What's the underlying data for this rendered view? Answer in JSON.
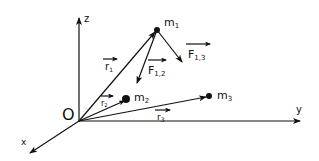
{
  "diagram": {
    "axes": {
      "origin": "O",
      "x": "x",
      "y": "y",
      "z": "z"
    },
    "masses": [
      {
        "id": "m1",
        "base": "m",
        "sub": "1"
      },
      {
        "id": "m2",
        "base": "m",
        "sub": "2"
      },
      {
        "id": "m3",
        "base": "m",
        "sub": "3"
      }
    ],
    "position_vectors": [
      {
        "id": "r1",
        "base": "r",
        "sub": "1"
      },
      {
        "id": "r2",
        "base": "r",
        "sub": "2"
      },
      {
        "id": "r3",
        "base": "r",
        "sub": "3"
      }
    ],
    "forces": [
      {
        "id": "F12",
        "base": "F",
        "sub": "1,2"
      },
      {
        "id": "F13",
        "base": "F",
        "sub": "1,3"
      }
    ],
    "colors": {
      "ink": "#111111",
      "background": "#ffffff"
    }
  }
}
